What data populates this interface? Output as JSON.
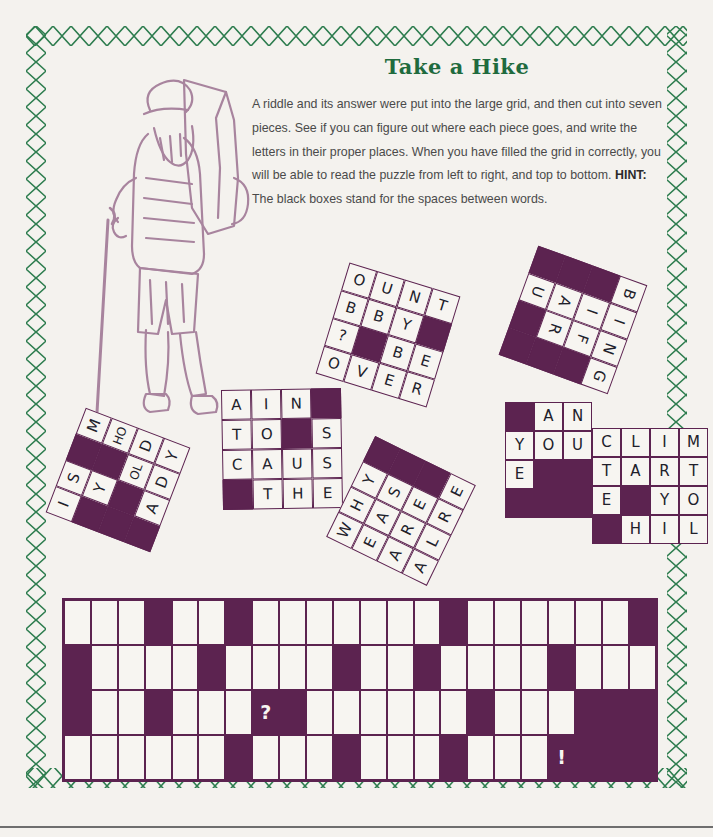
{
  "page": {
    "background_color": "#f4f2ee",
    "border_color": "#2e7d4f",
    "ink_color": "#5c2350",
    "illustration_color": "#a8849e"
  },
  "header": {
    "title": "Take a Hike",
    "title_color": "#1f6b3e",
    "instructions_part1": "A riddle and its answer were put into the large grid, and then cut into seven pieces. See if you can figure out where each piece goes, and write the letters in their proper places. When you have filled the grid in correctly, you will be able to read the puzzle from left to right, and top to bottom. ",
    "hint_label": "HINT:",
    "instructions_part2": " The black boxes stand for the spaces between words."
  },
  "illustration": {
    "name": "hiker-with-backpack",
    "description": "Line drawing of a bearded hiker carrying a large backpack and holding a walking stick"
  },
  "pieces": [
    {
      "id": "piece-is-my-hold-lady",
      "cols": 4,
      "rows": 4,
      "cell_size": 28,
      "left": 62,
      "top": 424,
      "rotation": -69,
      "rows_data": [
        [
          "I",
          "S",
          "#",
          "M"
        ],
        [
          "#",
          "Y",
          "#",
          "HO"
        ],
        [
          "#",
          "#",
          "OL",
          "D"
        ],
        [
          "#",
          "A",
          "D",
          "Y"
        ]
      ]
    },
    {
      "id": "piece-ain-to-s-caus-the",
      "cols": 4,
      "rows": 4,
      "cell_size": 30,
      "left": 222,
      "top": 389,
      "rotation": -1,
      "rows_data": [
        [
          "A",
          "I",
          "N",
          "#"
        ],
        [
          "T",
          "O",
          "#",
          "S"
        ],
        [
          "C",
          "A",
          "U",
          "S"
        ],
        [
          "#",
          "T",
          "H",
          "E"
        ]
      ]
    },
    {
      "id": "piece-ount-bby-be-over",
      "cols": 4,
      "rows": 4,
      "cell_size": 29,
      "left": 330,
      "top": 277,
      "rotation": 17,
      "rows_data": [
        [
          "O",
          "U",
          "N",
          "T"
        ],
        [
          "B",
          "B",
          "Y",
          "#"
        ],
        [
          "?",
          "#",
          "B",
          "E"
        ],
        [
          "O",
          "V",
          "E",
          "R"
        ]
      ]
    },
    {
      "id": "piece-bing-if-ar-u",
      "cols": 4,
      "rows": 3,
      "cell_size": 29,
      "left": 515,
      "top": 262,
      "rotation": 110,
      "rows_data": [
        [
          "B",
          "I",
          "N",
          "G"
        ],
        [
          "#",
          "I",
          "F",
          "#"
        ],
        [
          "#",
          "A",
          "R",
          "#"
        ],
        [
          "#",
          "U",
          "#",
          "#"
        ]
      ]
    },
    {
      "id": "piece-why-eas-are-alre",
      "cols": 4,
      "rows": 4,
      "cell_size": 28,
      "left": 345,
      "top": 455,
      "rotation": -64,
      "rows_data": [
        [
          "W",
          "H",
          "Y",
          "#"
        ],
        [
          "E",
          "A",
          "S",
          "#"
        ],
        [
          "A",
          "R",
          "E",
          "#"
        ],
        [
          "A",
          "L",
          "R",
          "E"
        ]
      ]
    },
    {
      "id": "piece-an-you-e",
      "cols": 3,
      "rows": 4,
      "cell_size": 29,
      "left": 505,
      "top": 402,
      "rotation": 0,
      "rows_data": [
        [
          "#",
          "A",
          "N"
        ],
        [
          "Y",
          "O",
          "U"
        ],
        [
          "E",
          "#",
          "#"
        ],
        [
          "#",
          "#",
          "#"
        ]
      ]
    },
    {
      "id": "piece-clim-tart-e-yo-hil",
      "cols": 4,
      "rows": 4,
      "cell_size": 29,
      "left": 592,
      "top": 428,
      "rotation": 0,
      "rows_data": [
        [
          "C",
          "L",
          "I",
          "M"
        ],
        [
          "T",
          "A",
          "R",
          "T"
        ],
        [
          "E",
          "#",
          "Y",
          "O"
        ],
        [
          "#",
          "H",
          "I",
          "L"
        ]
      ]
    }
  ],
  "main_grid": {
    "name": "answer-grid",
    "cols": 22,
    "rows": 4,
    "rows_data": [
      [
        ".",
        ".",
        ".",
        "#",
        ".",
        ".",
        "#",
        ".",
        ".",
        ".",
        ".",
        ".",
        ".",
        ".",
        "#",
        ".",
        ".",
        ".",
        ".",
        ".",
        ".",
        "#"
      ],
      [
        "#",
        ".",
        ".",
        ".",
        ".",
        "#",
        ".",
        ".",
        ".",
        ".",
        "#",
        ".",
        ".",
        "#",
        ".",
        ".",
        ".",
        ".",
        "#",
        ".",
        ".",
        "."
      ],
      [
        "#",
        ".",
        ".",
        "#",
        ".",
        ".",
        ".",
        "?",
        "#",
        ".",
        ".",
        ".",
        ".",
        ".",
        ".",
        "#",
        ".",
        ".",
        ".",
        "#",
        "#",
        "#"
      ],
      [
        ".",
        ".",
        ".",
        ".",
        ".",
        ".",
        "#",
        ".",
        ".",
        ".",
        "#",
        ".",
        ".",
        ".",
        "#",
        ".",
        ".",
        ".",
        "!",
        "#",
        "#",
        "#"
      ]
    ]
  }
}
